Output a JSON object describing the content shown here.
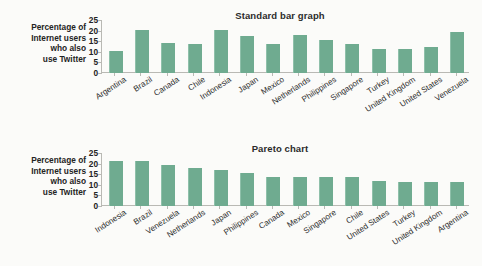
{
  "charts": [
    {
      "id": "standard-bar-graph",
      "title": "Standard bar graph",
      "axis_label_lines": [
        "Percentage of",
        "Internet users",
        "who also",
        "use Twitter"
      ],
      "yticks": [
        "25",
        "20",
        "15",
        "10",
        "5",
        "0"
      ]
    },
    {
      "id": "pareto-chart",
      "title": "Pareto chart",
      "axis_label_lines": [
        "Percentage of",
        "Internet users",
        "who also",
        "use Twitter"
      ],
      "yticks": [
        "25",
        "20",
        "15",
        "10",
        "5",
        "0"
      ]
    }
  ],
  "colors": {
    "bar": "#6fab90",
    "bar_highlight": "#8fc0aa",
    "axis": "#b9b9b4",
    "text": "#232323",
    "page_background": "#fbfbf9"
  },
  "chart_data": [
    {
      "type": "bar",
      "title": "Standard bar graph",
      "xlabel": "",
      "ylabel": "Percentage of Internet users who also use Twitter",
      "ylim": [
        0,
        25
      ],
      "yticks": [
        0,
        5,
        10,
        15,
        20,
        25
      ],
      "grid": false,
      "legend": "none",
      "sorted": "alphabetical-by-category",
      "categories": [
        "Argentina",
        "Brazil",
        "Canada",
        "Chile",
        "Indonesia",
        "Japan",
        "Mexico",
        "Netherlands",
        "Philippines",
        "Singapore",
        "Turkey",
        "United Kingdom",
        "United States",
        "Venezuela"
      ],
      "values": [
        10.5,
        20.3,
        14.2,
        13.7,
        20.5,
        17.3,
        13.9,
        17.7,
        15.4,
        13.8,
        11.3,
        11.1,
        12.4,
        19.3
      ]
    },
    {
      "type": "bar",
      "title": "Pareto chart",
      "xlabel": "",
      "ylabel": "Percentage of Internet users who also use Twitter",
      "ylim": [
        0,
        25
      ],
      "yticks": [
        0,
        5,
        10,
        15,
        20,
        25
      ],
      "grid": false,
      "legend": "none",
      "sorted": "descending-by-value",
      "categories": [
        "Indonesia",
        "Brazil",
        "Venezuela",
        "Netherlands",
        "Japan",
        "Philippines",
        "Canada",
        "Mexico",
        "Singapore",
        "Chile",
        "United States",
        "Turkey",
        "United Kingdom",
        "Argentina"
      ],
      "values": [
        21.4,
        21.1,
        19.2,
        17.9,
        17.2,
        15.4,
        13.9,
        13.7,
        13.5,
        13.5,
        12.0,
        11.4,
        11.2,
        11.1
      ]
    }
  ]
}
